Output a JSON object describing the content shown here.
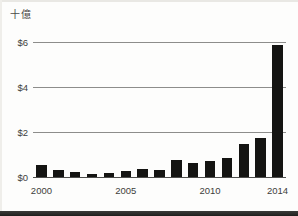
{
  "chart_data": {
    "type": "bar",
    "title": "十億",
    "subtitle": "",
    "xlabel": "",
    "ylabel": "十億",
    "categories": [
      "2000",
      "2001",
      "2002",
      "2003",
      "2004",
      "2005",
      "2006",
      "2007",
      "2008",
      "2009",
      "2010",
      "2011",
      "2012",
      "2013",
      "2014"
    ],
    "values": [
      0.55,
      0.33,
      0.22,
      0.15,
      0.2,
      0.28,
      0.35,
      0.32,
      0.75,
      0.62,
      0.7,
      0.85,
      1.45,
      1.75,
      2.2
    ],
    "values_display": [
      "$0.55",
      "$0.33",
      "$0.22",
      "$0.15",
      "$0.20",
      "$0.28",
      "$0.35",
      "$0.32",
      "$0.75",
      "$0.62",
      "$0.70",
      "$0.85",
      "$1.45",
      "$1.75",
      "$2.20"
    ],
    "bar_values_billions": [
      0.55,
      0.33,
      0.22,
      0.15,
      0.2,
      0.28,
      0.35,
      0.32,
      0.75,
      0.62,
      0.7,
      0.85,
      1.45,
      1.75,
      2.2
    ],
    "ylim": [
      0,
      6
    ],
    "y_ticks": [
      0,
      2,
      4,
      6
    ],
    "y_tick_labels": [
      "$0",
      "$2",
      "$4",
      "$6"
    ],
    "x_tick_labels": [
      "2000",
      "2005",
      "2010",
      "2014"
    ],
    "x_tick_categories": [
      "2000",
      "2005",
      "2010",
      "2014"
    ],
    "grid": true,
    "gridlines_at": [
      2,
      4,
      6
    ],
    "legend": "none",
    "legend_position": "none",
    "bar_color": "#141412",
    "gridline_color": "#8d8d8b",
    "axis_color": "#4d4d4b",
    "text_color": "#3d3d3b",
    "background_color": "#fdfdfc",
    "series": [
      {
        "name": "",
        "values": [
          0.55,
          0.33,
          0.22,
          0.15,
          0.2,
          0.28,
          0.35,
          0.32,
          0.75,
          0.62,
          0.7,
          0.85,
          1.45,
          1.75,
          2.2
        ]
      }
    ],
    "annotations": [],
    "note": "Last bar (2014) rises to approximately $5.85 billion"
  },
  "chart_bars": [
    {
      "year": "2000",
      "value": 0.55
    },
    {
      "year": "2001",
      "value": 0.33
    },
    {
      "year": "2002",
      "value": 0.22
    },
    {
      "year": "2003",
      "value": 0.15
    },
    {
      "year": "2004",
      "value": 0.2
    },
    {
      "year": "2005",
      "value": 0.28
    },
    {
      "year": "2006",
      "value": 0.35
    },
    {
      "year": "2007",
      "value": 0.32
    },
    {
      "year": "2008",
      "value": 0.75
    },
    {
      "year": "2009",
      "value": 0.62
    },
    {
      "year": "2010",
      "value": 0.7
    },
    {
      "year": "2011",
      "value": 0.85
    },
    {
      "year": "2012",
      "value": 1.45
    },
    {
      "year": "2013",
      "value": 1.75
    },
    {
      "year": "2014",
      "value": 5.85
    }
  ],
  "axes": {
    "y_labels": [
      "$6",
      "$4",
      "$2",
      "$0"
    ],
    "y_values": [
      6,
      4,
      2,
      0
    ],
    "x_labels": [
      {
        "label": "2000",
        "index": 0
      },
      {
        "label": "2005",
        "index": 5
      },
      {
        "label": "2010",
        "index": 10
      },
      {
        "label": "2014",
        "index": 14
      }
    ]
  },
  "unit_label": "十億"
}
